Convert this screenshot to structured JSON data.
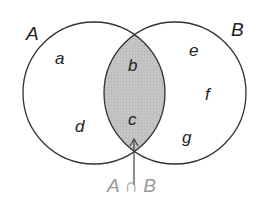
{
  "diagram": {
    "type": "venn",
    "sets": [
      {
        "name": "A",
        "elements": [
          "a",
          "d",
          "b",
          "c"
        ]
      },
      {
        "name": "B",
        "elements": [
          "e",
          "f",
          "g",
          "b",
          "c"
        ]
      }
    ],
    "only_A": [
      "a",
      "d"
    ],
    "intersection": [
      "b",
      "c"
    ],
    "only_B": [
      "e",
      "f",
      "g"
    ],
    "intersection_label": "A ∩ B",
    "colors": {
      "stroke": "#333333",
      "intersection_fill": "#c8c8c8",
      "intersection_label": "#999999"
    }
  },
  "labels": {
    "set_a": "A",
    "set_b": "B",
    "a": "a",
    "b": "b",
    "c": "c",
    "d": "d",
    "e": "e",
    "f": "f",
    "g": "g",
    "intersection": "A ∩ B"
  }
}
